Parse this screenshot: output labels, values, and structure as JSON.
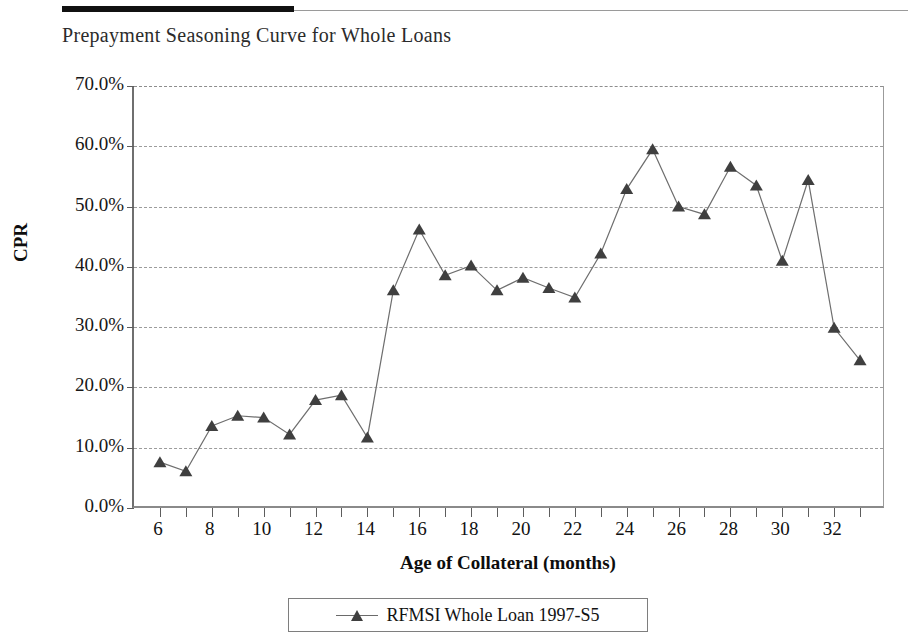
{
  "chart_data": {
    "type": "line",
    "title": "Prepayment Seasoning Curve for Whole Loans",
    "xlabel": "Age of Collateral (months)",
    "ylabel": "CPR",
    "xlim": [
      5,
      34
    ],
    "ylim": [
      0,
      70
    ],
    "y_tick_labels": [
      "0.0%",
      "10.0%",
      "20.0%",
      "30.0%",
      "40.0%",
      "50.0%",
      "60.0%",
      "70.0%"
    ],
    "y_tick_values": [
      0,
      10,
      20,
      30,
      40,
      50,
      60,
      70
    ],
    "x_tick_labels": [
      "6",
      "8",
      "10",
      "12",
      "14",
      "16",
      "18",
      "20",
      "22",
      "24",
      "26",
      "28",
      "30",
      "32"
    ],
    "x_tick_values": [
      6,
      8,
      10,
      12,
      14,
      16,
      18,
      20,
      22,
      24,
      26,
      28,
      30,
      32
    ],
    "x_minor_ticks": [
      6,
      7,
      8,
      9,
      10,
      11,
      12,
      13,
      14,
      15,
      16,
      17,
      18,
      19,
      20,
      21,
      22,
      23,
      24,
      25,
      26,
      27,
      28,
      29,
      30,
      31,
      32,
      33
    ],
    "grid": "horizontal-dashed",
    "legend_position": "bottom-outside",
    "marker": "triangle",
    "marker_color": "#3f3f3f",
    "line_color": "#6e6e6e",
    "x": [
      6,
      7,
      8,
      9,
      10,
      11,
      12,
      13,
      14,
      15,
      16,
      17,
      18,
      19,
      20,
      21,
      22,
      23,
      24,
      25,
      26,
      27,
      28,
      29,
      30,
      31,
      32,
      33
    ],
    "series": [
      {
        "name": "RFMSI  Whole Loan 1997-S5",
        "values": [
          7.6,
          6.1,
          13.6,
          15.3,
          15.0,
          12.2,
          17.9,
          18.7,
          11.7,
          36.1,
          46.2,
          38.6,
          40.2,
          36.1,
          38.2,
          36.5,
          34.9,
          42.2,
          52.9,
          59.5,
          50.0,
          48.7,
          56.6,
          53.5,
          41.0,
          54.4,
          29.9,
          24.5
        ]
      }
    ]
  },
  "legend": {
    "entries": [
      {
        "label": "RFMSI  Whole Loan 1997-S5"
      }
    ]
  }
}
